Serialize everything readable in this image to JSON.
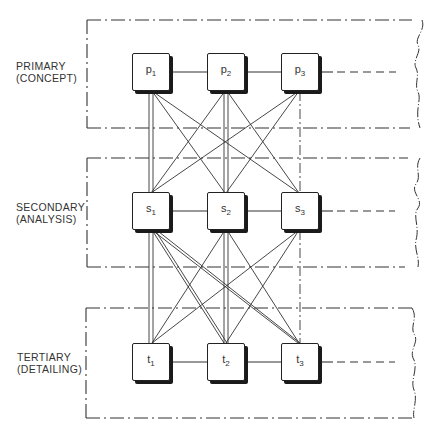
{
  "levels": [
    {
      "id": "primary",
      "name": "PRIMARY",
      "sub": "(CONCEPT)",
      "prefix": "p"
    },
    {
      "id": "secondary",
      "name": "SECONDARY",
      "sub": "(ANALYSIS)",
      "prefix": "s"
    },
    {
      "id": "tertiary",
      "name": "TERTIARY",
      "sub": "(DETAILING)",
      "prefix": "t"
    }
  ],
  "nodes": {
    "p1": {
      "base": "p",
      "index": "1"
    },
    "p2": {
      "base": "p",
      "index": "2"
    },
    "p3": {
      "base": "p",
      "index": "3"
    },
    "s1": {
      "base": "s",
      "index": "1"
    },
    "s2": {
      "base": "s",
      "index": "2"
    },
    "s3": {
      "base": "s",
      "index": "3"
    },
    "t1": {
      "base": "t",
      "index": "1"
    },
    "t2": {
      "base": "t",
      "index": "2"
    },
    "t3": {
      "base": "t",
      "index": "3"
    }
  },
  "edges": {
    "horizontal": [
      [
        "p1",
        "p2"
      ],
      [
        "p2",
        "p3"
      ],
      [
        "s1",
        "s2"
      ],
      [
        "s2",
        "s3"
      ],
      [
        "t1",
        "t2"
      ],
      [
        "t2",
        "t3"
      ]
    ],
    "continuation_dashed": [
      "p3",
      "s3",
      "t3"
    ],
    "vertical_double": [
      [
        "p1",
        "s1"
      ],
      [
        "p2",
        "s2"
      ],
      [
        "s1",
        "t1"
      ],
      [
        "s2",
        "t2"
      ],
      [
        "s1",
        "t2"
      ],
      [
        "s1",
        "t3"
      ]
    ],
    "vertical_single": [
      [
        "p1",
        "s2"
      ],
      [
        "p1",
        "s3"
      ],
      [
        "p2",
        "s1"
      ],
      [
        "p2",
        "s3"
      ],
      [
        "p3",
        "s1"
      ],
      [
        "p3",
        "s2"
      ],
      [
        "s2",
        "t1"
      ],
      [
        "s2",
        "t3"
      ],
      [
        "s3",
        "t1"
      ],
      [
        "s3",
        "t2"
      ]
    ],
    "vertical_dashdot": [
      [
        "p3",
        "s3"
      ],
      [
        "s3",
        "t3"
      ]
    ]
  }
}
